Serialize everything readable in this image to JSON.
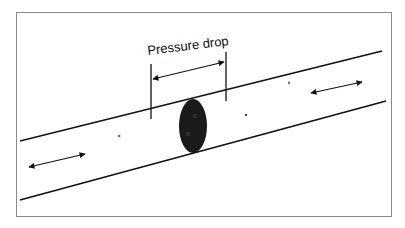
{
  "diagram": {
    "label": "Pressure drop",
    "colors": {
      "background": "#ffffff",
      "frame": "#8a8a8a",
      "lines": "#111111",
      "pig": "#1a1a1a"
    },
    "elements": [
      "upper-pipe-wall",
      "lower-pipe-wall",
      "pig-ellipse",
      "pressure-drop-marker-left",
      "pressure-drop-marker-right",
      "pressure-drop-arrow",
      "flow-arrow-left",
      "flow-arrow-right"
    ]
  }
}
